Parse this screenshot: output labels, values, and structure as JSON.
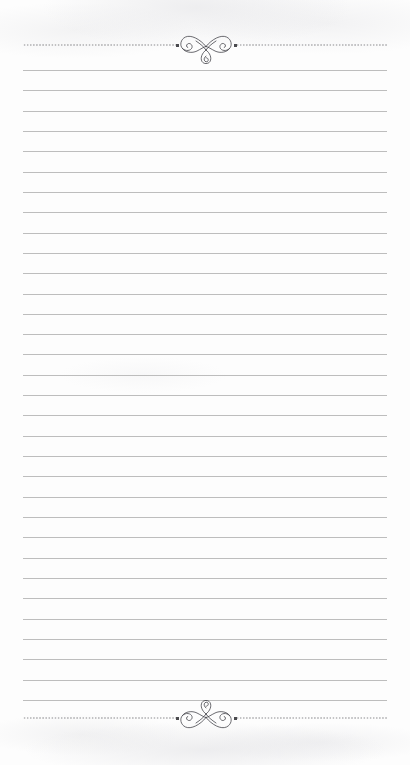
{
  "page": {
    "width": 410,
    "height": 765,
    "background_color": "#fdfdfd",
    "paper_tint": "#ffffff"
  },
  "colors": {
    "rule_line": "#bdbdbd",
    "dot": "#6e6e72",
    "dot_cap": "#4a4a4e",
    "ornament_stroke": "#3a3a40"
  },
  "content": {
    "text": "",
    "placeholder": "",
    "note": ""
  },
  "ruled_lines": {
    "count": 32,
    "first_y": 70,
    "spacing": 20.32,
    "left_x": 23,
    "right_x": 387,
    "thickness": 1
  },
  "borders": {
    "top": {
      "name": "top-dotted-rule",
      "y": 45,
      "left_x": 23,
      "right_x": 387,
      "gap_left_x": 177,
      "gap_right_x": 236,
      "cap_left_x": 176,
      "cap_right_x": 234
    },
    "bottom": {
      "name": "bottom-dotted-rule",
      "y": 718,
      "left_x": 23,
      "right_x": 387,
      "gap_left_x": 177,
      "gap_right_x": 236,
      "cap_left_x": 176,
      "cap_right_x": 234
    }
  },
  "ornaments": [
    {
      "name": "top-flourish",
      "style": "calligraphic-bowtie-flourish",
      "x": 178,
      "y": 31,
      "width": 56,
      "height": 34,
      "orientation": "upright"
    },
    {
      "name": "bottom-flourish",
      "style": "calligraphic-bowtie-flourish",
      "x": 178,
      "y": 699,
      "width": 56,
      "height": 34,
      "orientation": "mirrored-vertical"
    }
  ]
}
